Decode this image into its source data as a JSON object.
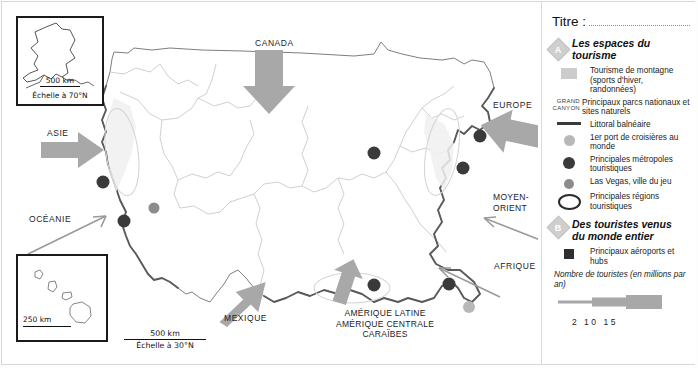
{
  "legend": {
    "titre_label": "Titre :",
    "section_a": {
      "badge": "A",
      "title": "Les espaces du tourisme",
      "items": [
        {
          "key": "mountain-swatch",
          "code": "",
          "text": "Tourisme de montagne (sports d'hiver, randonnées)"
        },
        {
          "key": "park-code",
          "code": "GRAND CANYON",
          "text": "Principaux parcs nationaux et sites naturels"
        },
        {
          "key": "coast-line",
          "code": "",
          "text": "Littoral balnéaire"
        },
        {
          "key": "cruise-dot",
          "code": "",
          "text": "1er port de croisières au monde"
        },
        {
          "key": "metropolis-dot",
          "code": "",
          "text": "Principales métropoles touristiques"
        },
        {
          "key": "lasvegas-dot",
          "code": "",
          "text": "Las Vegas, ville du jeu"
        },
        {
          "key": "region-ellipse",
          "code": "",
          "text": "Principales régions touristiques"
        }
      ]
    },
    "section_b": {
      "badge": "B",
      "title": "Des touristes venus du monde entier",
      "items": [
        {
          "key": "airport-square",
          "code": "",
          "text": "Principaux aéroports et hubs"
        }
      ],
      "flow_title": "Nombre de touristes (en millions par an)",
      "flow_values": "2  10 15"
    }
  },
  "map": {
    "insets": [
      {
        "name": "alaska",
        "scale_distance": "500 km",
        "scale_note": "Échelle à 70°N"
      },
      {
        "name": "hawaii",
        "scale_distance": "250 km",
        "scale_note": ""
      }
    ],
    "main_scale": {
      "distance": "500 km",
      "note": "Échelle à 30°N"
    },
    "flow_labels": [
      {
        "name": "canada",
        "text": "CANADA"
      },
      {
        "name": "europe",
        "text": "EUROPE"
      },
      {
        "name": "asie",
        "text": "ASIE"
      },
      {
        "name": "oceanie",
        "text": "OCÉANIE"
      },
      {
        "name": "moyen-orient",
        "text": "MOYEN-\nORIENT"
      },
      {
        "name": "afrique",
        "text": "AFRIQUE"
      },
      {
        "name": "mexique",
        "text": "MEXIQUE"
      },
      {
        "name": "amerique-latine",
        "text": "AMÉRIQUE LATINE\nAMÉRIQUE CENTRALE\nCARAÏBES"
      }
    ]
  },
  "colors": {
    "flow_arrow": "#a8a8a8",
    "thin_arrow": "#9a9a9a",
    "metropolis": "#3a3a3a",
    "lasvegas": "#8c8c8c",
    "cruise": "#b8b8b8",
    "coast": "#5a5a5a",
    "border": "#7e7e7e",
    "rivers": "#c9c9c9",
    "mountain": "#cccccc",
    "airport": "#2f2f2f"
  }
}
